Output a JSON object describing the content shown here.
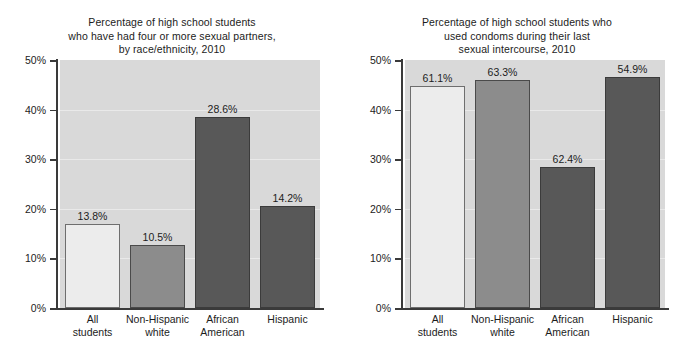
{
  "figure": {
    "width": 689,
    "height": 355,
    "background": "#ffffff",
    "plot_background": "#d9d9d9",
    "gridline_color": "#e9e9e9",
    "axis_color": "#3a3a3a",
    "text_color": "#1c1c1c"
  },
  "chart_data": [
    {
      "type": "bar",
      "panel": "left",
      "title": "Percentage of high school students who have had four or more sexual partners, by race/ethnicity, 2010",
      "title_lines": [
        "Percentage of high school students",
        "who have had four or more sexual partners,",
        "by race/ethnicity, 2010"
      ],
      "xlabel": "",
      "ylabel": "",
      "ylim": [
        0,
        50
      ],
      "yticks": [
        0,
        10,
        20,
        30,
        40,
        50
      ],
      "ytick_labels": [
        "0%",
        "10%",
        "20%",
        "30%",
        "40%",
        "50%"
      ],
      "grid": true,
      "legend": "none",
      "categories": [
        "All students",
        "Non-Hispanic white",
        "African American",
        "Hispanic"
      ],
      "category_lines": [
        [
          "All",
          "students"
        ],
        [
          "Non-Hispanic",
          "white"
        ],
        [
          "African",
          "American"
        ],
        [
          "Hispanic"
        ]
      ],
      "data_labels": [
        "13.8%",
        "10.5%",
        "28.6%",
        "14.2%"
      ],
      "values": [
        16.9,
        12.8,
        38.5,
        20.6
      ],
      "bar_styles": [
        "style-light",
        "style-mid",
        "style-dark",
        "style-dark"
      ],
      "bar_colors": [
        "#ececec",
        "#8c8c8c",
        "#585858",
        "#585858"
      ]
    },
    {
      "type": "bar",
      "panel": "right",
      "title": "Percentage of high school students who used condoms during their last sexual intercourse, 2010",
      "title_lines": [
        "Percentage of high school students who",
        "used condoms during their last",
        "sexual intercourse, 2010"
      ],
      "xlabel": "",
      "ylabel": "",
      "ylim": [
        0,
        50
      ],
      "yticks": [
        0,
        10,
        20,
        30,
        40,
        50
      ],
      "ytick_labels": [
        "0%",
        "10%",
        "20%",
        "30%",
        "40%",
        "50%"
      ],
      "grid": true,
      "legend": "none",
      "categories": [
        "All students",
        "Non-Hispanic white",
        "African American",
        "Hispanic"
      ],
      "category_lines": [
        [
          "All",
          "students"
        ],
        [
          "Non-Hispanic",
          "white"
        ],
        [
          "African",
          "American"
        ],
        [
          "Hispanic"
        ]
      ],
      "data_labels": [
        "61.1%",
        "63.3%",
        "62.4%",
        "54.9%"
      ],
      "values": [
        44.8,
        46.0,
        28.4,
        46.6
      ],
      "bar_styles": [
        "style-light",
        "style-mid",
        "style-dark",
        "style-dark"
      ],
      "bar_colors": [
        "#ececec",
        "#8c8c8c",
        "#585858",
        "#585858"
      ]
    }
  ]
}
